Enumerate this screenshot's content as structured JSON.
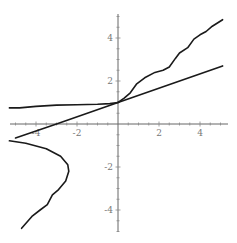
{
  "chart_data": {
    "type": "line",
    "title": "",
    "xlabel": "",
    "ylabel": "",
    "xlim": [
      -5.3,
      5.1
    ],
    "ylim": [
      -5.1,
      5.3
    ],
    "grid": false,
    "legend": null,
    "x_ticks": [
      -4,
      -2,
      2,
      4
    ],
    "y_ticks": [
      4,
      2,
      -2,
      -4
    ],
    "x_tick_labels": [
      "-4",
      "-2",
      "2",
      "4"
    ],
    "y_tick_labels": [
      "4",
      "2",
      "-2",
      "-4"
    ],
    "series": [
      {
        "name": "straight-line",
        "points": [
          [
            -5.0,
            -0.65
          ],
          [
            -3.0,
            0.0
          ],
          [
            0.0,
            1.0
          ],
          [
            5.1,
            2.7
          ]
        ]
      },
      {
        "name": "wavy-rising-curve",
        "points": [
          [
            0.0,
            1.0
          ],
          [
            0.3,
            1.2
          ],
          [
            0.6,
            1.45
          ],
          [
            0.9,
            1.85
          ],
          [
            1.3,
            2.15
          ],
          [
            1.8,
            2.4
          ],
          [
            2.2,
            2.5
          ],
          [
            2.5,
            2.65
          ],
          [
            2.8,
            3.05
          ],
          [
            3.0,
            3.3
          ],
          [
            3.4,
            3.55
          ],
          [
            3.7,
            3.95
          ],
          [
            4.0,
            4.15
          ],
          [
            4.3,
            4.3
          ],
          [
            4.6,
            4.55
          ],
          [
            5.1,
            4.85
          ]
        ]
      },
      {
        "name": "left-flat-curve",
        "points": [
          [
            -5.3,
            0.75
          ],
          [
            -4.8,
            0.75
          ],
          [
            -4.0,
            0.82
          ],
          [
            -3.0,
            0.88
          ],
          [
            -2.0,
            0.9
          ],
          [
            -1.0,
            0.92
          ],
          [
            -0.4,
            0.95
          ],
          [
            0.0,
            1.0
          ]
        ]
      },
      {
        "name": "lower-bulge-curve",
        "points": [
          [
            -5.3,
            -0.78
          ],
          [
            -4.5,
            -0.9
          ],
          [
            -3.5,
            -1.15
          ],
          [
            -2.8,
            -1.5
          ],
          [
            -2.45,
            -1.9
          ],
          [
            -2.4,
            -2.2
          ],
          [
            -2.55,
            -2.65
          ],
          [
            -2.9,
            -3.05
          ],
          [
            -3.2,
            -3.3
          ],
          [
            -3.45,
            -3.75
          ],
          [
            -3.8,
            -4.0
          ],
          [
            -4.2,
            -4.3
          ],
          [
            -4.7,
            -4.85
          ]
        ]
      }
    ]
  },
  "caption_fragment": ""
}
